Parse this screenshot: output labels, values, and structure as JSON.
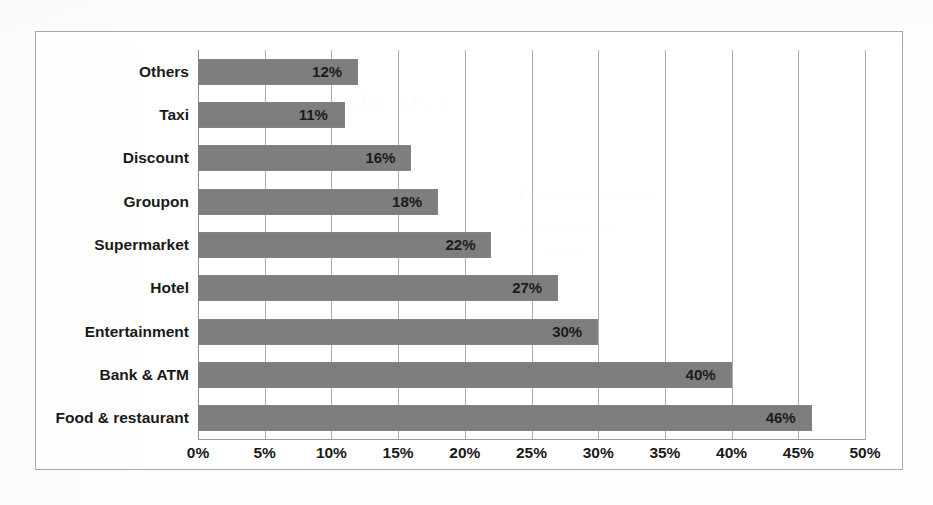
{
  "chart_data": {
    "type": "bar",
    "orientation": "horizontal",
    "title": "",
    "xlabel": "",
    "ylabel": "",
    "xlim": [
      0,
      50
    ],
    "xtick_labels": [
      "0%",
      "5%",
      "10%",
      "15%",
      "20%",
      "25%",
      "30%",
      "35%",
      "40%",
      "45%",
      "50%"
    ],
    "xtick_values": [
      0,
      5,
      10,
      15,
      20,
      25,
      30,
      35,
      40,
      45,
      50
    ],
    "grid": true,
    "legend": false,
    "categories": [
      "Others",
      "Taxi",
      "Discount",
      "Groupon",
      "Supermarket",
      "Hotel",
      "Entertainment",
      "Bank & ATM",
      "Food & restaurant"
    ],
    "values": [
      12,
      11,
      16,
      18,
      22,
      27,
      30,
      40,
      46
    ],
    "data_labels": [
      "12%",
      "11%",
      "16%",
      "18%",
      "22%",
      "27%",
      "30%",
      "40%",
      "46%"
    ],
    "bar_color": "#7e7e7e",
    "gridline_color": "#aeaeae",
    "border_color": "#a8a8a8",
    "background_color": "#ffffff"
  },
  "ghost_text": [
    {
      "text": "a, ... fy i .. d n ... i",
      "left": 330,
      "top": 92,
      "size": 15
    },
    {
      "text": "...",
      "left": 660,
      "top": 92,
      "size": 15
    },
    {
      "text": "i .. . . . . . .  . .. . . .   . .  .",
      "left": 520,
      "top": 185,
      "size": 15
    },
    {
      "text": ". . .  . . . .  . .  .  .",
      "left": 525,
      "top": 213,
      "size": 15
    },
    {
      "text": ".  . .   .  .",
      "left": 545,
      "top": 241,
      "size": 15
    },
    {
      "text": ".  .  . .  .",
      "left": 520,
      "top": 268,
      "size": 15
    },
    {
      "text": ".   .  .",
      "left": 540,
      "top": 296,
      "size": 15
    },
    {
      "text": ".     .",
      "left": 120,
      "top": 430,
      "size": 15
    },
    {
      "text": ".        .",
      "left": 470,
      "top": 487,
      "size": 15
    }
  ]
}
